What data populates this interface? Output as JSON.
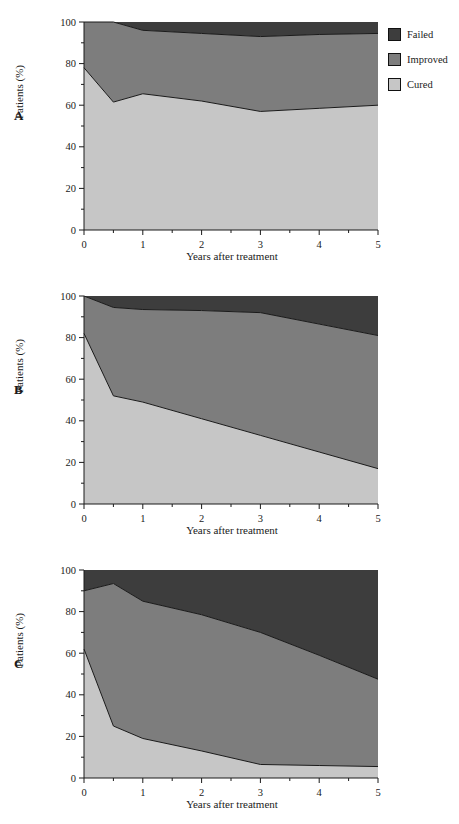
{
  "figure": {
    "panels": [
      "A",
      "B",
      "C"
    ],
    "axis": {
      "xlabel": "Years after treatment",
      "ylabel": "Patients (%)",
      "xticks": [
        "0",
        "1",
        "2",
        "3",
        "4",
        "5"
      ],
      "yticks": [
        "0",
        "20",
        "40",
        "60",
        "80",
        "100"
      ]
    },
    "legend": {
      "position": "top-right",
      "items": [
        {
          "label": "Failed",
          "color": "#3d3d3d"
        },
        {
          "label": "Improved",
          "color": "#7d7d7d"
        },
        {
          "label": "Cured",
          "color": "#c6c6c6"
        }
      ]
    }
  },
  "chart_data": [
    {
      "type": "area",
      "panel": "A",
      "title": "A",
      "xlabel": "Years after treatment",
      "ylabel": "Patients (%)",
      "xlim": [
        0,
        5
      ],
      "ylim": [
        0,
        100
      ],
      "xticks": [
        0,
        1,
        2,
        3,
        4,
        5
      ],
      "yticks": [
        0,
        20,
        40,
        60,
        80,
        100
      ],
      "grid": false,
      "stacked": true,
      "x": [
        0,
        0.5,
        1,
        2,
        3,
        4,
        5
      ],
      "series": [
        {
          "name": "Cured",
          "color": "#c6c6c6",
          "values": [
            78,
            61.5,
            65.5,
            62,
            57,
            58.5,
            60
          ]
        },
        {
          "name": "Improved",
          "color": "#7d7d7d",
          "values": [
            22,
            38.5,
            30.5,
            32.5,
            36,
            35.5,
            34.5
          ]
        },
        {
          "name": "Failed",
          "color": "#3d3d3d",
          "values": [
            0,
            0,
            4,
            5.5,
            7,
            6,
            5.5
          ]
        }
      ],
      "cumulative_cured": [
        78,
        61.5,
        65.5,
        62,
        57,
        58.5,
        60
      ],
      "cumulative_cured_improved": [
        100,
        100,
        96,
        94.5,
        93,
        94,
        94.5
      ]
    },
    {
      "type": "area",
      "panel": "B",
      "title": "B",
      "xlabel": "Years after treatment",
      "ylabel": "Patients (%)",
      "xlim": [
        0,
        5
      ],
      "ylim": [
        0,
        100
      ],
      "xticks": [
        0,
        1,
        2,
        3,
        4,
        5
      ],
      "yticks": [
        0,
        20,
        40,
        60,
        80,
        100
      ],
      "grid": false,
      "stacked": true,
      "x": [
        0,
        0.5,
        1,
        2,
        3,
        4,
        5
      ],
      "series": [
        {
          "name": "Cured",
          "color": "#c6c6c6",
          "values": [
            82,
            52,
            49,
            41,
            33,
            25,
            17
          ]
        },
        {
          "name": "Improved",
          "color": "#7d7d7d",
          "values": [
            18,
            42.5,
            44.5,
            52,
            59,
            61.5,
            64
          ]
        },
        {
          "name": "Failed",
          "color": "#3d3d3d",
          "values": [
            0,
            5.5,
            6.5,
            7,
            8,
            13.5,
            19
          ]
        }
      ],
      "cumulative_cured": [
        82,
        52,
        49,
        41,
        33,
        25,
        17
      ],
      "cumulative_cured_improved": [
        100,
        94.5,
        93.5,
        93,
        92,
        86.5,
        81
      ]
    },
    {
      "type": "area",
      "panel": "C",
      "title": "C",
      "xlabel": "Years after treatment",
      "ylabel": "Patients (%)",
      "xlim": [
        0,
        5
      ],
      "ylim": [
        0,
        100
      ],
      "xticks": [
        0,
        1,
        2,
        3,
        4,
        5
      ],
      "yticks": [
        0,
        20,
        40,
        60,
        80,
        100
      ],
      "grid": false,
      "stacked": true,
      "x": [
        0,
        0.5,
        1,
        2,
        3,
        4,
        5
      ],
      "series": [
        {
          "name": "Cured",
          "color": "#c6c6c6",
          "values": [
            62,
            25,
            19,
            13,
            6.5,
            6,
            5.5
          ]
        },
        {
          "name": "Improved",
          "color": "#7d7d7d",
          "values": [
            28,
            68.5,
            66,
            65.5,
            63.5,
            53,
            42
          ]
        },
        {
          "name": "Failed",
          "color": "#3d3d3d",
          "values": [
            10,
            6.5,
            15,
            21.5,
            30,
            41,
            52.5
          ]
        }
      ],
      "cumulative_cured": [
        62,
        25,
        19,
        13,
        6.5,
        6,
        5.5
      ],
      "cumulative_cured_improved": [
        90,
        93.5,
        85,
        78.5,
        70,
        59,
        47.5
      ]
    }
  ]
}
